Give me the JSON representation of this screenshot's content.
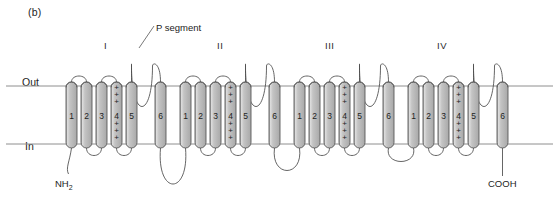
{
  "figure": {
    "panel_label": "(b)",
    "callout": {
      "p_segment_label": "P segment"
    },
    "membrane": {
      "outside_label": "Out",
      "inside_label": "In",
      "outer_line_y": 86,
      "inner_line_y": 144,
      "line_color": "#8e8e8e",
      "x_start": 6,
      "x_end": 553
    },
    "termini": {
      "n_terminus": "NH",
      "n_terminus_sub": "2",
      "c_terminus": "COOH"
    },
    "colors": {
      "background": "#ffffff",
      "cylinder_fill": "#b8b8b8",
      "cylinder_highlight": "#d9d9d9",
      "cylinder_stroke": "#5a5a5a",
      "chain_stroke": "#4a4a4a",
      "text": "#232323"
    },
    "geometry": {
      "cylinder_top": 82,
      "cylinder_bottom": 148,
      "cylinder_width": 11,
      "cylinder_radius": 5.5
    },
    "domains": [
      {
        "numeral": "I",
        "numeral_x": 108,
        "segments": [
          {
            "label": "1",
            "x": 66,
            "charged": false
          },
          {
            "label": "2",
            "x": 81,
            "charged": false
          },
          {
            "label": "3",
            "x": 96,
            "charged": false
          },
          {
            "label": "4",
            "x": 111,
            "charged": true
          },
          {
            "label": "5",
            "x": 126,
            "charged": false
          },
          {
            "label": "6",
            "x": 155,
            "charged": false
          }
        ],
        "p_segment": {
          "from_x": 131.5,
          "to_x": 160.5,
          "depth_y": 120
        }
      },
      {
        "numeral": "II",
        "numeral_x": 221,
        "segments": [
          {
            "label": "1",
            "x": 180,
            "charged": false
          },
          {
            "label": "2",
            "x": 195,
            "charged": false
          },
          {
            "label": "3",
            "x": 210,
            "charged": false
          },
          {
            "label": "4",
            "x": 225,
            "charged": true
          },
          {
            "label": "5",
            "x": 240,
            "charged": false
          },
          {
            "label": "6",
            "x": 269,
            "charged": false
          }
        ],
        "p_segment": {
          "from_x": 245.5,
          "to_x": 274.5,
          "depth_y": 120
        }
      },
      {
        "numeral": "III",
        "numeral_x": 329,
        "segments": [
          {
            "label": "1",
            "x": 294,
            "charged": false
          },
          {
            "label": "2",
            "x": 309,
            "charged": false
          },
          {
            "label": "3",
            "x": 324,
            "charged": false
          },
          {
            "label": "4",
            "x": 339,
            "charged": true
          },
          {
            "label": "5",
            "x": 354,
            "charged": false
          },
          {
            "label": "6",
            "x": 383,
            "charged": false
          }
        ],
        "p_segment": {
          "from_x": 359.5,
          "to_x": 388.5,
          "depth_y": 120
        }
      },
      {
        "numeral": "IV",
        "numeral_x": 441,
        "segments": [
          {
            "label": "1",
            "x": 408,
            "charged": false
          },
          {
            "label": "2",
            "x": 423,
            "charged": false
          },
          {
            "label": "3",
            "x": 438,
            "charged": false
          },
          {
            "label": "4",
            "x": 453,
            "charged": true
          },
          {
            "label": "5",
            "x": 468,
            "charged": false
          },
          {
            "label": "6",
            "x": 497,
            "charged": false
          }
        ],
        "p_segment": {
          "from_x": 473.5,
          "to_x": 502.5,
          "depth_y": 120
        }
      }
    ],
    "charge_marks": {
      "symbol": "+",
      "count_top": 3,
      "count_bottom": 3,
      "top_ys": [
        90,
        97,
        104
      ],
      "bottom_ys": [
        126,
        133,
        140
      ]
    }
  }
}
